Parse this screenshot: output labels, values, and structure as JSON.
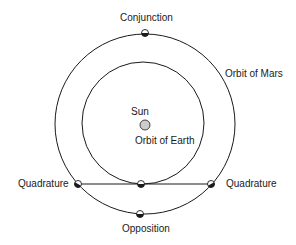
{
  "diagram": {
    "labels": {
      "conjunction": "Conjunction",
      "orbit_mars": "Orbit of Mars",
      "sun": "Sun",
      "orbit_earth": "Orbit of Earth",
      "quadrature_left": "Quadrature",
      "quadrature_right": "Quadrature",
      "opposition": "Opposition"
    },
    "colors": {
      "line": "#1a1a1a",
      "sun_fill": "#cccccc",
      "background": "#ffffff"
    }
  }
}
